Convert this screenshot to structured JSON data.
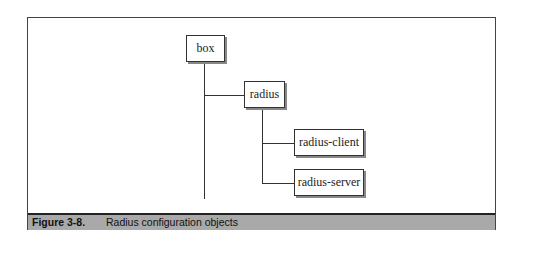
{
  "diagram": {
    "nodes": [
      {
        "id": "box",
        "label": "box"
      },
      {
        "id": "radius",
        "label": "radius"
      },
      {
        "id": "radius-client",
        "label": "radius-client"
      },
      {
        "id": "radius-server",
        "label": "radius-server"
      }
    ],
    "edges": [
      {
        "from": "box",
        "to": "radius"
      },
      {
        "from": "radius",
        "to": "radius-client"
      },
      {
        "from": "radius",
        "to": "radius-server"
      }
    ]
  },
  "caption": {
    "number": "Figure 3-8.",
    "text": "Radius configuration objects",
    "band_color": "#a9a9a9"
  }
}
